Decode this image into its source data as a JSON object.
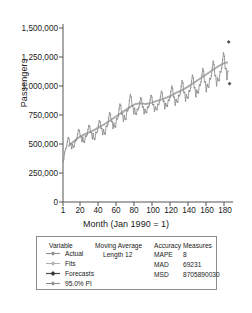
{
  "chart_data": {
    "type": "line",
    "title": "",
    "xlabel": "Month (Jan 1990 = 1)",
    "ylabel": "Passengers",
    "xlim": [
      1,
      198
    ],
    "ylim": [
      0,
      1500000
    ],
    "grid": false,
    "legend_position": "below-plot",
    "y_ticks": [
      "0",
      "250,000",
      "500,000",
      "750,000",
      "1,000,000",
      "1,250,000",
      "1,500,000"
    ],
    "y_tick_values": [
      0,
      250000,
      500000,
      750000,
      1000000,
      1250000,
      1500000
    ],
    "x_ticks": [
      "1",
      "20",
      "40",
      "60",
      "80",
      "100",
      "120",
      "140",
      "160",
      "180"
    ],
    "x_tick_values": [
      1,
      20,
      40,
      60,
      80,
      100,
      120,
      140,
      160,
      180
    ],
    "series": [
      {
        "name": "Actual",
        "color": "#8c8c8c",
        "x": [
          1,
          2,
          3,
          4,
          5,
          6,
          7,
          8,
          9,
          10,
          11,
          12,
          13,
          14,
          15,
          16,
          17,
          18,
          19,
          20,
          21,
          22,
          23,
          24,
          25,
          26,
          27,
          28,
          29,
          30,
          31,
          32,
          33,
          34,
          35,
          36,
          37,
          38,
          39,
          40,
          41,
          42,
          43,
          44,
          45,
          46,
          47,
          48,
          49,
          50,
          51,
          52,
          53,
          54,
          55,
          56,
          57,
          58,
          59,
          60,
          61,
          62,
          63,
          64,
          65,
          66,
          67,
          68,
          69,
          70,
          71,
          72,
          73,
          74,
          75,
          76,
          77,
          78,
          79,
          80,
          81,
          82,
          83,
          84,
          85,
          86,
          87,
          88,
          89,
          90,
          91,
          92,
          93,
          94,
          95,
          96,
          97,
          98,
          99,
          100,
          101,
          102,
          103,
          104,
          105,
          106,
          107,
          108,
          109,
          110,
          111,
          112,
          113,
          114,
          115,
          116,
          117,
          118,
          119,
          120,
          121,
          122,
          123,
          124,
          125,
          126,
          127,
          128,
          129,
          130,
          131,
          132,
          133,
          134,
          135,
          136,
          137,
          138,
          139,
          140,
          141,
          142,
          143,
          144,
          145,
          146,
          147,
          148,
          149,
          150,
          151,
          152,
          153,
          154,
          155,
          156,
          157,
          158,
          159,
          160,
          161,
          162,
          163,
          164,
          165,
          166,
          167,
          168,
          169,
          170,
          171,
          172,
          173,
          174,
          175,
          176,
          177,
          178,
          179,
          180,
          181,
          182,
          183,
          184,
          185,
          186,
          187,
          188,
          189,
          190,
          191,
          192
        ],
        "values": [
          350000,
          370000,
          430000,
          455000,
          470000,
          520000,
          555000,
          545000,
          500000,
          505000,
          460000,
          495000,
          470000,
          480000,
          520000,
          530000,
          545000,
          585000,
          625000,
          615000,
          570000,
          565000,
          520000,
          560000,
          520000,
          515000,
          570000,
          565000,
          580000,
          625000,
          660000,
          650000,
          600000,
          600000,
          545000,
          590000,
          545000,
          540000,
          600000,
          595000,
          610000,
          660000,
          700000,
          690000,
          635000,
          635000,
          580000,
          625000,
          590000,
          585000,
          655000,
          650000,
          670000,
          725000,
          770000,
          755000,
          695000,
          695000,
          635000,
          680000,
          650000,
          645000,
          720000,
          715000,
          735000,
          800000,
          845000,
          830000,
          760000,
          760000,
          695000,
          745000,
          715000,
          710000,
          790000,
          785000,
          805000,
          875000,
          925000,
          905000,
          830000,
          830000,
          760000,
          810000,
          760000,
          755000,
          800000,
          795000,
          815000,
          860000,
          900000,
          885000,
          820000,
          820000,
          760000,
          800000,
          775000,
          770000,
          820000,
          815000,
          835000,
          880000,
          920000,
          905000,
          840000,
          840000,
          780000,
          820000,
          800000,
          795000,
          845000,
          840000,
          865000,
          910000,
          955000,
          940000,
          870000,
          870000,
          805000,
          850000,
          830000,
          825000,
          880000,
          875000,
          900000,
          950000,
          1000000,
          980000,
          905000,
          905000,
          835000,
          885000,
          865000,
          860000,
          920000,
          915000,
          940000,
          995000,
          1045000,
          1025000,
          945000,
          945000,
          870000,
          925000,
          900000,
          895000,
          960000,
          955000,
          985000,
          1040000,
          1095000,
          1070000,
          985000,
          985000,
          905000,
          965000,
          945000,
          940000,
          1010000,
          1005000,
          1035000,
          1095000,
          1150000,
          1125000,
          1035000,
          1035000,
          950000,
          1015000,
          995000,
          990000,
          1065000,
          1060000,
          1090000,
          1155000,
          1215000,
          1185000,
          1090000,
          1090000,
          1000000,
          1070000,
          1050000,
          1045000,
          1125000,
          1120000,
          1155000,
          1225000,
          1285000,
          1255000,
          1150000,
          1150000,
          1055000,
          1130000
        ]
      },
      {
        "name": "Fits",
        "color": "#a6a6a6",
        "description": "Centered 12-month moving average smooth line",
        "x": [
          7,
          13,
          19,
          25,
          31,
          37,
          43,
          49,
          55,
          61,
          67,
          73,
          79,
          85,
          91,
          97,
          103,
          109,
          115,
          121,
          127,
          133,
          139,
          145,
          151,
          157,
          163,
          169,
          175,
          181,
          187,
          192
        ],
        "values": [
          480000,
          520000,
          555000,
          580000,
          600000,
          620000,
          645000,
          670000,
          700000,
          730000,
          760000,
          790000,
          820000,
          845000,
          850000,
          845000,
          855000,
          870000,
          885000,
          900000,
          920000,
          945000,
          965000,
          990000,
          1020000,
          1050000,
          1080000,
          1110000,
          1140000,
          1170000,
          1195000,
          1205000
        ]
      },
      {
        "name": "Forecasts",
        "color": "#4d4d4d",
        "x": [
          193,
          194
        ],
        "values": [
          1380000,
          1020000
        ]
      }
    ],
    "legend": {
      "variable_header": "Variable",
      "entries": [
        {
          "label": "Actual",
          "color": "#8c8c8c",
          "symbol": "line-marker"
        },
        {
          "label": "Fits",
          "color": "#a6a6a6",
          "symbol": "line-marker"
        },
        {
          "label": "Forecasts",
          "color": "#4d4d4d",
          "symbol": "line-marker"
        },
        {
          "label": "95.0% PI",
          "color": "#8c8c8c",
          "symbol": "line-marker"
        }
      ]
    },
    "moving_average": {
      "header": "Moving Average",
      "length_label": "Length 12"
    },
    "accuracy_measures": {
      "header": "Accuracy Measures",
      "rows": [
        {
          "name": "MAPE",
          "value": "8"
        },
        {
          "name": "MAD",
          "value": "69231"
        },
        {
          "name": "MSD",
          "value": "8705890030"
        }
      ]
    }
  }
}
